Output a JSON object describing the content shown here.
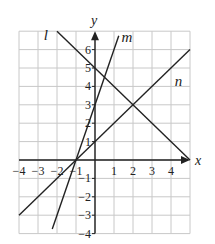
{
  "chart_data": {
    "type": "line",
    "title": "",
    "xlabel": "x",
    "ylabel": "y",
    "xlim": [
      -4,
      5
    ],
    "ylim": [
      -4,
      7
    ],
    "grid": true,
    "x_ticks": [
      "−4",
      "−3",
      "−2",
      "−1",
      "1",
      "2",
      "3",
      "4"
    ],
    "x_tick_values": [
      -4,
      -3,
      -2,
      -1,
      1,
      2,
      3,
      4
    ],
    "y_ticks": [
      "−4",
      "−3",
      "−2",
      "−1",
      "1",
      "2",
      "3",
      "4",
      "5",
      "6"
    ],
    "y_tick_values": [
      -4,
      -3,
      -2,
      -1,
      1,
      2,
      3,
      4,
      5,
      6
    ],
    "series": [
      {
        "name": "l",
        "equation": "y = -x + 5",
        "points": [
          [
            -2,
            7
          ],
          [
            5,
            0
          ]
        ],
        "label_pos": [
          -2.7,
          6.5
        ]
      },
      {
        "name": "m",
        "equation": "y = 3x + 3",
        "points": [
          [
            -2.25,
            -3.75
          ],
          [
            1.25,
            6.75
          ]
        ],
        "label_pos": [
          1.4,
          6.4
        ]
      },
      {
        "name": "n",
        "equation": "y = x + 1",
        "points": [
          [
            -4,
            -3
          ],
          [
            5,
            6
          ]
        ],
        "label_pos": [
          4.2,
          4.0
        ]
      }
    ],
    "intersections": [
      [
        -1,
        0
      ],
      [
        2,
        3
      ],
      [
        0.5,
        4.5
      ]
    ]
  }
}
